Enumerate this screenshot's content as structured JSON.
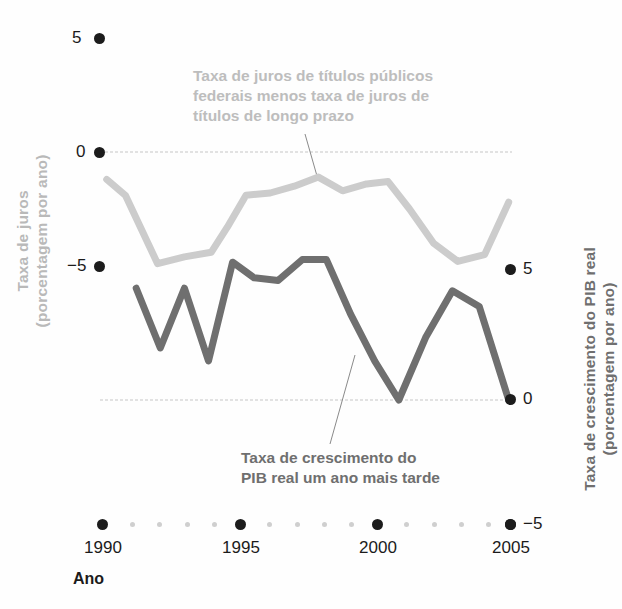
{
  "axes": {
    "left": {
      "title_line1": "Taxa de juros",
      "title_line2": "(porcentagem por ano)",
      "ticks": [
        "5",
        "0",
        "−5"
      ],
      "color": "#b9b9b9"
    },
    "right": {
      "title_line1": "Taxa de crescimento do PIB real",
      "title_line2": "(porcentagem por ano)",
      "ticks": [
        "5",
        "0",
        "−5"
      ],
      "color": "#6f6f6f"
    },
    "x": {
      "title": "Ano",
      "labels": [
        "1990",
        "1995",
        "2000",
        "2005"
      ]
    }
  },
  "annotations": {
    "spread": {
      "line1": "Taxa de juros de títulos públicos",
      "line2": "federais menos taxa de juros de",
      "line3": "títulos de longo prazo"
    },
    "gdp": {
      "line1": "Taxa de crescimento do",
      "line2": "PIB real um ano mais tarde"
    }
  },
  "chart_data": {
    "type": "line",
    "title": "",
    "xlabel": "Ano",
    "grid": false,
    "legend": "annotations-inline",
    "xlim": [
      1990,
      2005
    ],
    "x_ticks": [
      1990,
      1995,
      2000,
      2005
    ],
    "axes": {
      "left": {
        "label": "Taxa de juros (porcentagem por ano)",
        "ylim": [
          -5,
          5
        ],
        "y_ticks": [
          -5,
          0,
          5
        ]
      },
      "right": {
        "label": "Taxa de crescimento do PIB real (porcentagem por ano)",
        "ylim": [
          -5,
          5
        ],
        "y_ticks": [
          -5,
          0,
          5
        ]
      }
    },
    "series": [
      {
        "name": "Taxa de juros de títulos públicos federais menos taxa de juros de títulos de longo prazo",
        "axis": "left",
        "color": "#cccccc",
        "x": [
          1990.1,
          1990.8,
          1992.0,
          1993.0,
          1994.0,
          1994.6,
          1995.3,
          1996.2,
          1997.1,
          1998.0,
          1998.9,
          1999.8,
          2000.6,
          2001.4,
          2002.3,
          2003.2,
          2004.2,
          2005.1
        ],
        "values": [
          -1.2,
          -1.9,
          -4.9,
          -4.6,
          -4.4,
          -3.3,
          -1.9,
          -1.8,
          -1.5,
          -1.1,
          -1.7,
          -1.4,
          -1.3,
          -2.5,
          -4.0,
          -4.8,
          -4.5,
          -2.2
        ]
      },
      {
        "name": "Taxa de crescimento do PIB real um ano mais tarde",
        "axis": "right",
        "color": "#6f6f6f",
        "x": [
          1991.2,
          1992.1,
          1993.0,
          1993.9,
          1994.8,
          1995.6,
          1996.5,
          1997.4,
          1998.3,
          1999.2,
          2000.1,
          2001.0,
          2002.0,
          2003.0,
          2004.0,
          2005.1
        ],
        "values": [
          4.3,
          2.0,
          4.3,
          1.5,
          5.3,
          4.7,
          4.6,
          5.4,
          5.4,
          3.3,
          1.5,
          0.0,
          2.4,
          4.2,
          3.6,
          0.0
        ]
      }
    ]
  },
  "colors": {
    "spread_line": "#cccccc",
    "gdp_line": "#6f6f6f",
    "zero_line": "#d8d8d8",
    "tick_dot": "#1c1c1c",
    "minor_tick_dot": "#cfcfcf"
  }
}
